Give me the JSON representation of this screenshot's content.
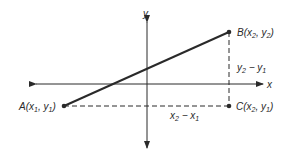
{
  "diagram": {
    "axes": {
      "x_label": "x",
      "y_label": "y"
    },
    "points": {
      "A": {
        "name": "A",
        "coord": "(x1, y1)",
        "x_sub": "1",
        "y_sub": "1"
      },
      "B": {
        "name": "B",
        "coord": "(x2, y2)",
        "x_sub": "2",
        "y_sub": "2"
      },
      "C": {
        "name": "C",
        "coord": "(x2, y1)",
        "x_sub": "2",
        "y_sub": "1"
      }
    },
    "segments": {
      "vertical_label": "y2 − y1",
      "horizontal_label": "x2 − x1"
    },
    "colors": {
      "stroke": "#2a2a2a",
      "background": "#ffffff"
    }
  }
}
